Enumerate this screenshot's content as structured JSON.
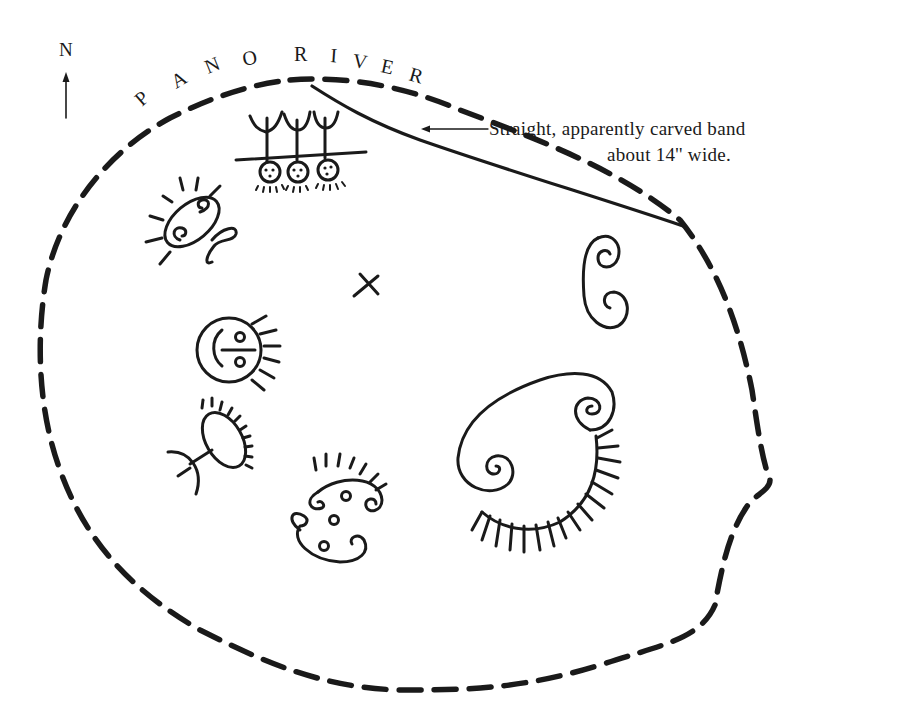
{
  "diagram": {
    "type": "petroglyph site sketch map",
    "north_label": "N",
    "river_label": "PANO RIVER",
    "river_letters": [
      "P",
      "A",
      "N",
      "O",
      "R",
      "I",
      "V",
      "E",
      "R"
    ],
    "annotation": {
      "line1": "Straight, apparently carved band",
      "line2": "about 14'' wide."
    },
    "marker": "×",
    "colors": {
      "ink": "#1a1a1a",
      "background": "#ffffff"
    },
    "elements": [
      "rock-outline-dashed",
      "carved-band-line",
      "three-trident-figures",
      "rayed-spiral-figure-left",
      "x-mark",
      "double-spiral-right",
      "rayed-face-circle",
      "rayed-oval-with-stem",
      "rayed-dotted-spiral-figure",
      "large-double-spiral-rayed-figure"
    ]
  }
}
